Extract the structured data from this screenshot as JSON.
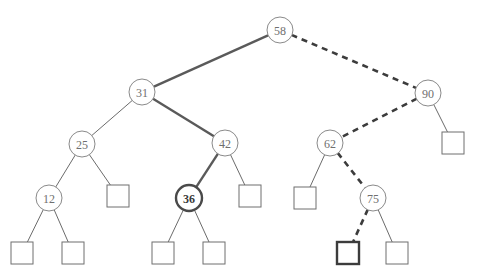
{
  "figure": {
    "name": "binary-search-tree-diagram",
    "type": "tree-diagram",
    "width": 477,
    "height": 280,
    "background": "#ffffff"
  },
  "style": {
    "node_stroke": "#8a8a8a",
    "node_stroke_highlight": "#4a4a4a",
    "node_fill": "#ffffff",
    "label_color": "#6f6f6f",
    "label_color_highlight": "#3a3a3a",
    "edge_color_thin": "#6b6b6b",
    "edge_color_thick": "#5a5a5a",
    "edge_color_dashed": "#3c3c3c",
    "leaf_stroke": "#6f6f6f",
    "leaf_stroke_highlight": "#3c3c3c",
    "leaf_fill": "#ffffff",
    "node_radius": 13,
    "node_radius_highlight": 13,
    "leaf_size": 22,
    "stroke_width_thin": 1,
    "stroke_width_thick": 2.4,
    "stroke_width_dashed": 2.6,
    "dash_pattern": "6,5",
    "font_size": 12,
    "font_size_highlight": 12
  },
  "nodes": [
    {
      "id": "n58",
      "label": "58",
      "x": 280,
      "y": 30,
      "highlight": false
    },
    {
      "id": "n31",
      "label": "31",
      "x": 142,
      "y": 92,
      "highlight": false
    },
    {
      "id": "n90",
      "label": "90",
      "x": 428,
      "y": 93,
      "highlight": false
    },
    {
      "id": "n25",
      "label": "25",
      "x": 82,
      "y": 144,
      "highlight": false
    },
    {
      "id": "n42",
      "label": "42",
      "x": 225,
      "y": 143,
      "highlight": false
    },
    {
      "id": "n62",
      "label": "62",
      "x": 330,
      "y": 143,
      "highlight": false
    },
    {
      "id": "n12",
      "label": "12",
      "x": 49,
      "y": 198,
      "highlight": false
    },
    {
      "id": "n36",
      "label": "36",
      "x": 189,
      "y": 198,
      "highlight": true
    },
    {
      "id": "n75",
      "label": "75",
      "x": 373,
      "y": 198,
      "highlight": false
    }
  ],
  "leaves": [
    {
      "id": "l25r",
      "x": 118,
      "y": 196,
      "highlight": false
    },
    {
      "id": "l42r",
      "x": 250,
      "y": 196,
      "highlight": false
    },
    {
      "id": "l62l",
      "x": 305,
      "y": 198,
      "highlight": false
    },
    {
      "id": "l90r",
      "x": 453,
      "y": 143,
      "highlight": false
    },
    {
      "id": "l12l",
      "x": 22,
      "y": 253,
      "highlight": false
    },
    {
      "id": "l12r",
      "x": 73,
      "y": 253,
      "highlight": false
    },
    {
      "id": "l36l",
      "x": 163,
      "y": 253,
      "highlight": false
    },
    {
      "id": "l36r",
      "x": 214,
      "y": 253,
      "highlight": false
    },
    {
      "id": "l75l",
      "x": 348,
      "y": 253,
      "highlight": true
    },
    {
      "id": "l75r",
      "x": 397,
      "y": 253,
      "highlight": false
    }
  ],
  "edges": [
    {
      "from": "n58",
      "to": "n31",
      "style": "thick"
    },
    {
      "from": "n58",
      "to": "n90",
      "style": "dashed"
    },
    {
      "from": "n31",
      "to": "n25",
      "style": "thin"
    },
    {
      "from": "n31",
      "to": "n42",
      "style": "thick"
    },
    {
      "from": "n90",
      "to": "n62",
      "style": "dashed"
    },
    {
      "from": "n90",
      "to": "l90r",
      "style": "thin"
    },
    {
      "from": "n25",
      "to": "n12",
      "style": "thin"
    },
    {
      "from": "n25",
      "to": "l25r",
      "style": "thin"
    },
    {
      "from": "n42",
      "to": "n36",
      "style": "thick"
    },
    {
      "from": "n42",
      "to": "l42r",
      "style": "thin"
    },
    {
      "from": "n62",
      "to": "l62l",
      "style": "thin"
    },
    {
      "from": "n62",
      "to": "n75",
      "style": "dashed"
    },
    {
      "from": "n12",
      "to": "l12l",
      "style": "thin"
    },
    {
      "from": "n12",
      "to": "l12r",
      "style": "thin"
    },
    {
      "from": "n36",
      "to": "l36l",
      "style": "thin"
    },
    {
      "from": "n36",
      "to": "l36r",
      "style": "thin"
    },
    {
      "from": "n75",
      "to": "l75l",
      "style": "dashed"
    },
    {
      "from": "n75",
      "to": "l75r",
      "style": "thin"
    }
  ]
}
